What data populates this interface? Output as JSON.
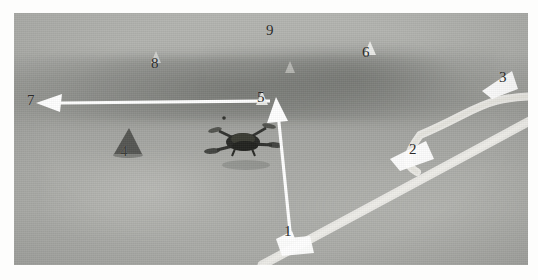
{
  "figure": {
    "kind": "annotated-aerial-photograph",
    "palette": {
      "turf_light": "#b4b5b1",
      "turf_mid": "#a4a5a1",
      "turf_dark_band": "#8f918d",
      "field_marking": "#efeee9",
      "annotation_arrow": "#ffffff",
      "label_text": "#2a2a28",
      "page_background": "#ffffff"
    },
    "plate": {
      "left": 14,
      "top": 13,
      "width": 514,
      "height": 252
    }
  },
  "annotations": [
    {
      "id": "1",
      "label": "1",
      "x": 290,
      "y": 232,
      "marker": "arrowhead",
      "points_to": "straight-white-boundary-line"
    },
    {
      "id": "2",
      "label": "2",
      "x": 415,
      "y": 150,
      "marker": "arrowhead",
      "points_to": "line-intersection"
    },
    {
      "id": "3",
      "label": "3",
      "x": 505,
      "y": 78,
      "marker": "arrowhead",
      "points_to": "curved-white-marking"
    },
    {
      "id": "4",
      "label": "4",
      "x": 126,
      "y": 152,
      "marker": "none",
      "points_to": "traffic-cone"
    },
    {
      "id": "5",
      "label": "5",
      "x": 263,
      "y": 98,
      "marker": "arrowhead",
      "points_to": "drone"
    },
    {
      "id": "6",
      "label": "6",
      "x": 368,
      "y": 53,
      "marker": "tick",
      "points_to": "far-turf-region"
    },
    {
      "id": "7",
      "label": "7",
      "x": 33,
      "y": 101,
      "marker": "arrow",
      "points_to": "flight-direction"
    },
    {
      "id": "8",
      "label": "8",
      "x": 157,
      "y": 64,
      "marker": "tick",
      "points_to": "shadow-band"
    },
    {
      "id": "9",
      "label": "9",
      "x": 272,
      "y": 31,
      "marker": "tick",
      "points_to": "background-turf"
    }
  ],
  "objects": {
    "drone": {
      "name": "quadcopter-drone",
      "x": 241,
      "y": 140,
      "width": 52,
      "height": 30
    },
    "cone": {
      "name": "traffic-cone",
      "x": 126,
      "y": 154,
      "width": 26,
      "height": 28
    }
  }
}
